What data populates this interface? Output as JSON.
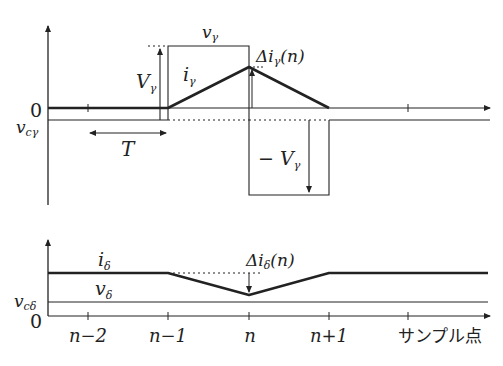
{
  "diagram": {
    "upper_panel": {
      "y_zero_label": "0",
      "v_c_label": "v_cγ",
      "v_c_label_main": "v",
      "v_c_label_sub": "cγ",
      "pulse_label_main": "v",
      "pulse_label_sub": "γ",
      "current_label_main": "i",
      "current_label_sub": "γ",
      "amplitude_label_main": "V",
      "amplitude_label_sub": "γ",
      "neg_amplitude_label_main": "− V",
      "neg_amplitude_label_sub": "γ",
      "delta_label_prefix": "Δi",
      "delta_label_sub": "γ",
      "delta_label_suffix": "(n)",
      "period_label": "T"
    },
    "lower_panel": {
      "y_zero_label": "0",
      "v_c_label_main": "v",
      "v_c_label_sub": "cδ",
      "current_label_main": "i",
      "current_label_sub": "δ",
      "voltage_label_main": "v",
      "voltage_label_sub": "δ",
      "delta_label_prefix": "Δi",
      "delta_label_sub": "δ",
      "delta_label_suffix": "(n)"
    },
    "x_axis": {
      "ticks": [
        "n−2",
        "n−1",
        "n",
        "n+1"
      ],
      "axis_title": "サンプル点"
    },
    "colors": {
      "line": "#222222",
      "background": "#ffffff"
    }
  }
}
